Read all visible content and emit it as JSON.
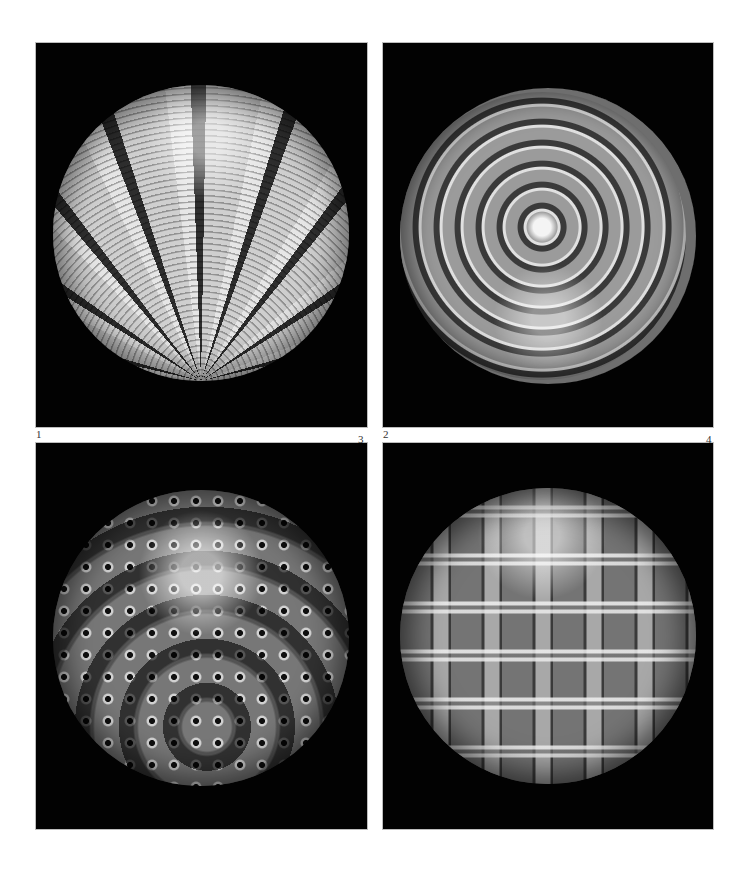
{
  "page": {
    "background": "#ffffff"
  },
  "plates": [
    {
      "number": "1",
      "subject": "Glass paperweight with radiating millefiori cane panels separated by twisted ribbons",
      "plate_background": "#020202"
    },
    {
      "number": "2",
      "subject": "Glass paperweight with concentric rows of cup-shaped canes around a central cluster",
      "plate_background": "#020202"
    },
    {
      "number": "3",
      "subject": "Glass paperweight with concentric rings of dark-centred cogwheel canes",
      "plate_background": "#020202"
    },
    {
      "number": "4",
      "subject": "Glass paperweight with latticework of twisted ribbons and millefiori canes",
      "plate_background": "#020202"
    }
  ],
  "labels": {
    "top_left": "1",
    "top_left_right": "3",
    "top_right": "2",
    "top_right_right": "4"
  }
}
